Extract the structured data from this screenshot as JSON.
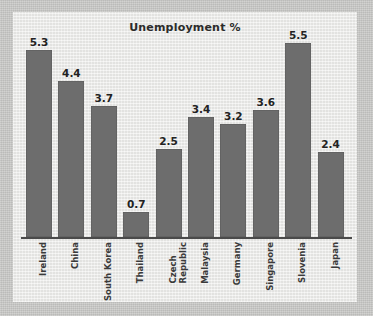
{
  "chart_data": {
    "type": "bar",
    "title": "Unemployment %",
    "xlabel": "",
    "ylabel": "",
    "ylim": [
      0,
      5.8
    ],
    "grid": false,
    "legend": null,
    "orientation": "vertical",
    "bar_color": "#6d6d6d",
    "categories": [
      "Ireland",
      "China",
      "South Korea",
      "Thailand",
      "Czech Republic",
      "Malaysia",
      "Germany",
      "Singapore",
      "Slovenia",
      "Japan"
    ],
    "category_lines": [
      [
        "Ireland"
      ],
      [
        "China"
      ],
      [
        "South Korea"
      ],
      [
        "Thailand"
      ],
      [
        "Czech",
        "Republic"
      ],
      [
        "Malaysia"
      ],
      [
        "Germany"
      ],
      [
        "Singapore"
      ],
      [
        "Slovenia"
      ],
      [
        "Japan"
      ]
    ],
    "values": [
      5.3,
      4.4,
      3.7,
      0.7,
      2.5,
      3.4,
      3.2,
      3.6,
      5.5,
      2.4
    ],
    "value_labels": [
      "5.3",
      "4.4",
      "3.7",
      "0.7",
      "2.5",
      "3.4",
      "3.2",
      "3.6",
      "5.5",
      "2.4"
    ]
  },
  "figure": {
    "background_color": "#c8c8c6",
    "panel_color": "#ececea",
    "axis_color": "#4a4a4a",
    "text_color": "#2b2b2b"
  }
}
